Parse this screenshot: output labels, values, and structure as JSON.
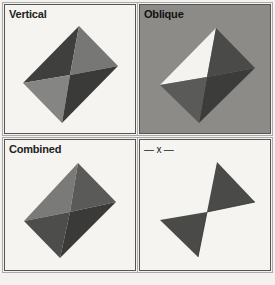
{
  "panels": [
    {
      "id": "vertical",
      "label": "Vertical",
      "background": "#f5f4f0",
      "faces": {
        "top_left": "#3f3f3d",
        "top_right": "#777775",
        "bottom_left": "#858583",
        "bottom_right": "#3a3a38"
      }
    },
    {
      "id": "oblique",
      "label": "Oblique",
      "background": "#8c8b88",
      "faces": {
        "top_left": "#f4f3ef",
        "top_right": "#4a4a48",
        "bottom_left": "#5a5a58",
        "bottom_right": "#3c3c3a"
      }
    },
    {
      "id": "combined",
      "label": "Combined",
      "background": "#f5f4f0",
      "faces": {
        "top_left": "#7a7a78",
        "top_right": "#5a5a58",
        "bottom_left": "#4d4d4b",
        "bottom_right": "#3a3a38"
      }
    },
    {
      "id": "x",
      "label": "— x —",
      "background": "#f5f4f0",
      "faces": {
        "top_right": "#4a4a48",
        "bottom_left": "#4a4a48"
      }
    }
  ]
}
